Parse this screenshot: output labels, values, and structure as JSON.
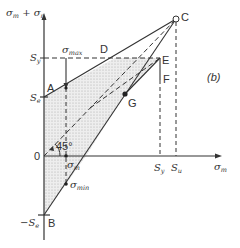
{
  "figure": {
    "panel_label": "(b)",
    "y_axis_label": "σm + σr",
    "x_axis_label": "σm",
    "origin_label": "0",
    "angle_label": "45°",
    "y_ticks": {
      "sy": "S",
      "sy_sub": "y",
      "se": "S",
      "se_sub": "e",
      "neg_se": "−S",
      "neg_se_sub": "e"
    },
    "x_ticks": {
      "sy": "S",
      "sy_sub": "y",
      "su": "S",
      "su_sub": "u"
    },
    "points": {
      "A": "A",
      "B": "B",
      "C": "C",
      "D": "D",
      "E": "E",
      "F": "F",
      "G": "G"
    },
    "annotations": {
      "sigma_max": "σ",
      "sigma_max_sub": "max",
      "sigma_m": "σ",
      "sigma_m_sub": "m",
      "sigma_min": "σ",
      "sigma_min_sub": "min"
    },
    "colors": {
      "line": "#333333",
      "shade": "#d9d9d9"
    }
  }
}
